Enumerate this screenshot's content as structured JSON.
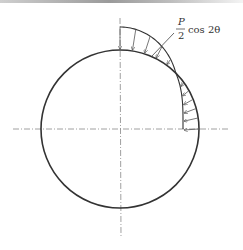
{
  "diagram": {
    "type": "pressure-distribution-on-circle",
    "label": {
      "numerator": "P",
      "denominator": "2",
      "function": "cos 2θ"
    },
    "circle": {
      "cx": 120,
      "cy": 129,
      "r": 79
    },
    "envelope": {
      "top_amplitude": 23,
      "side_amplitude": 16
    },
    "colors": {
      "line": "#333333",
      "axis": "#888888",
      "arrow": "#555555"
    }
  }
}
